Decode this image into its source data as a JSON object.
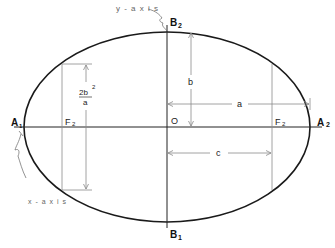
{
  "diagram": {
    "type": "ellipse-geometry",
    "colors": {
      "ellipse": "#1a1a1a",
      "axis": "#222222",
      "guide": "#8a8a8a",
      "callout": "#777777"
    },
    "labels": {
      "vertex_left_main": "A",
      "vertex_left_sub": "1",
      "vertex_right_main": "A",
      "vertex_right_sub": "2",
      "covertex_top_main": "B",
      "covertex_top_sub": "2",
      "covertex_bottom_main": "B",
      "covertex_bottom_sub": "1",
      "focus_left_main": "F",
      "focus_left_sub": "2",
      "focus_right_main": "F",
      "focus_right_sub": "2",
      "center": "O",
      "semi_minor": "b",
      "semi_major": "a",
      "focal_distance": "c",
      "latus_numerator": "2b",
      "latus_exponent": "2",
      "latus_denominator": "a",
      "y_axis_callout": "y - a x i s",
      "x_axis_callout": "x - a x i s"
    }
  }
}
